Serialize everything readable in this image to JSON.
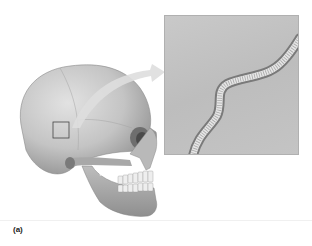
{
  "figure": {
    "panel_label": "(a)",
    "highlight_region": "square box on parietal region of skull",
    "inset": "magnified view of cranial suture",
    "arrow": "curved arrow from highlighted box to magnified inset"
  },
  "colors": {
    "background": "#ffffff",
    "skull": "#c8c8c8",
    "skull_shadow": "#8a8a8a",
    "inset_bg": "#c2c2c2",
    "suture_light": "#e4e4e4",
    "suture_dark": "#7a7a7a",
    "arrow": "#dcdcdc"
  }
}
